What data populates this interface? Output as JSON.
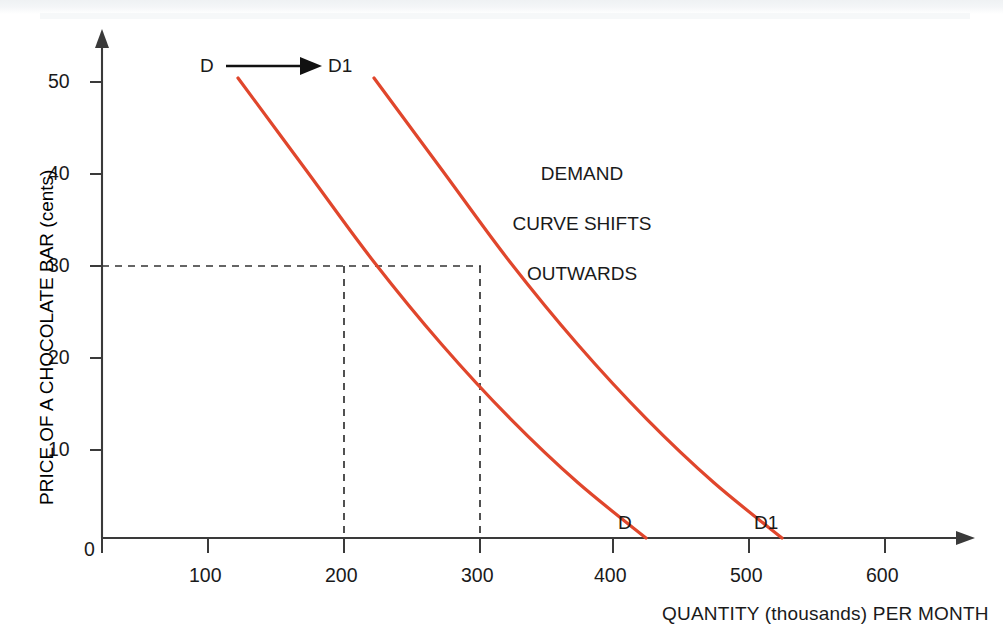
{
  "chart_data": {
    "type": "line",
    "title": "",
    "xlabel": "QUANTITY (thousands) PER MONTH",
    "ylabel": "PRICE OF A CHOCOLATE BAR (cents)",
    "xlim": [
      0,
      650
    ],
    "ylim": [
      0,
      55
    ],
    "xticks": [
      100,
      200,
      300,
      400,
      500,
      600
    ],
    "yticks": [
      10,
      20,
      30,
      40,
      50
    ],
    "origin_label": "0",
    "grid": false,
    "legend": "none",
    "series": [
      {
        "name": "D",
        "label_top": "D",
        "label_bottom": "D",
        "color": "#e0462c",
        "points": [
          {
            "x": 100,
            "y": 50
          },
          {
            "x": 150,
            "y": 40
          },
          {
            "x": 200,
            "y": 30
          },
          {
            "x": 250,
            "y": 21
          },
          {
            "x": 300,
            "y": 13
          },
          {
            "x": 350,
            "y": 6
          },
          {
            "x": 400,
            "y": 0
          }
        ]
      },
      {
        "name": "D1",
        "label_top": "D1",
        "label_bottom": "D1",
        "color": "#e0462c",
        "points": [
          {
            "x": 200,
            "y": 50
          },
          {
            "x": 250,
            "y": 40
          },
          {
            "x": 300,
            "y": 30
          },
          {
            "x": 350,
            "y": 21
          },
          {
            "x": 400,
            "y": 13
          },
          {
            "x": 450,
            "y": 6
          },
          {
            "x": 500,
            "y": 0
          }
        ]
      }
    ],
    "annotations": [
      {
        "name": "shift-note",
        "text": "DEMAND\nCURVE SHIFTS\nOUTWARDS"
      },
      {
        "name": "shift-arrow",
        "from_label": "D",
        "to_label": "D1",
        "direction": "right"
      }
    ],
    "guides": [
      {
        "name": "price-guide",
        "price": 30,
        "quantities": [
          200,
          300
        ],
        "style": "dashed"
      }
    ]
  },
  "axes": {
    "x_tick_labels": [
      "100",
      "200",
      "300",
      "400",
      "500",
      "600"
    ],
    "y_tick_labels": [
      "10",
      "20",
      "30",
      "40",
      "50"
    ],
    "origin": "0",
    "x_axis_title": "QUANTITY (thousands) PER MONTH",
    "y_axis_title": "PRICE OF A CHOCOLATE BAR (cents)"
  },
  "labels": {
    "d_top": "D",
    "d1_top": "D1",
    "d_bottom": "D",
    "d1_bottom": "D1",
    "note_line1": "DEMAND",
    "note_line2": "CURVE SHIFTS",
    "note_line3": "OUTWARDS"
  },
  "colors": {
    "curve": "#e0462c",
    "axis": "#3a3a3a",
    "text": "#1a1a1a",
    "background": "#ffffff"
  }
}
